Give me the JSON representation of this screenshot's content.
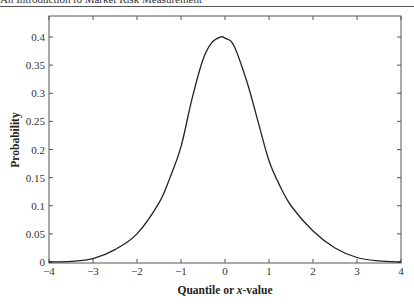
{
  "page": {
    "running_header": "An Introduction to Market Risk Measurement"
  },
  "chart_data": {
    "type": "line",
    "title": "",
    "xlabel_parts": [
      "Quantile or ",
      "x",
      "-value"
    ],
    "xlabel": "Quantile or x-value",
    "ylabel": "Probability",
    "xlim": [
      -4,
      4
    ],
    "ylim": [
      0,
      0.44
    ],
    "grid": false,
    "legend": null,
    "x_ticks": [
      -4,
      -3,
      -2,
      -1,
      0,
      1,
      2,
      3,
      4
    ],
    "x_tick_labels": [
      "−4",
      "−3",
      "−2",
      "−1",
      "0",
      "1",
      "2",
      "3",
      "4"
    ],
    "y_ticks": [
      0,
      0.05,
      0.1,
      0.15,
      0.2,
      0.25,
      0.3,
      0.35,
      0.4
    ],
    "y_tick_labels": [
      "0",
      "0.05",
      "0.1",
      "0.15",
      "0.2",
      "0.25",
      "0.3",
      "0.35",
      "0.4"
    ],
    "series": [
      {
        "name": "Probability density",
        "color": "#222222",
        "x": [
          -4,
          -3.5,
          -3,
          -2.5,
          -2,
          -1.5,
          -1.25,
          -1,
          -0.75,
          -0.5,
          -0.3,
          -0.1,
          0,
          0.2,
          0.5,
          0.75,
          1,
          1.25,
          1.5,
          2,
          2.5,
          3,
          3.5,
          4
        ],
        "y": [
          0.0,
          0.001,
          0.006,
          0.022,
          0.05,
          0.105,
          0.15,
          0.205,
          0.29,
          0.36,
          0.39,
          0.4,
          0.398,
          0.385,
          0.32,
          0.25,
          0.18,
          0.135,
          0.1,
          0.055,
          0.025,
          0.008,
          0.002,
          0.0
        ]
      }
    ]
  }
}
